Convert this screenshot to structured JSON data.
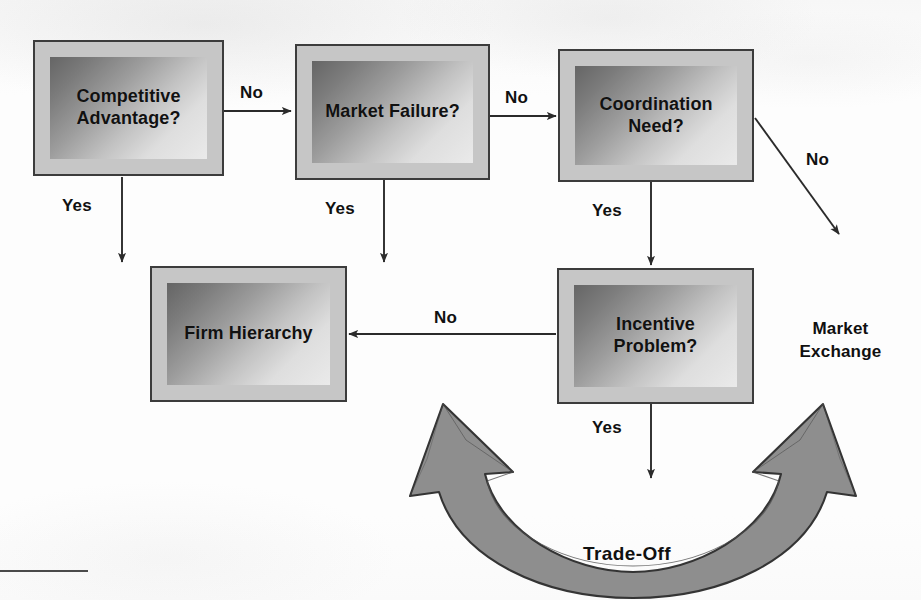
{
  "diagram": {
    "background_color": "#fcfcfc",
    "box_border_color": "#3c3c3c",
    "box_frame_color": "#c6c6c6",
    "box_gradient_from": "#656565",
    "box_gradient_to": "#eaeaea",
    "arrow_color": "#2b2b2b",
    "tradeoff_fill": "#8e8e8e",
    "tradeoff_stroke": "#3a3a3a"
  },
  "nodes": [
    {
      "id": "competitive-advantage",
      "label": "Competitive\nAdvantage?"
    },
    {
      "id": "market-failure",
      "label": "Market\nFailure?"
    },
    {
      "id": "coordination-need",
      "label": "Coordination\nNeed?"
    },
    {
      "id": "firm-hierarchy",
      "label": "Firm\nHierarchy"
    },
    {
      "id": "incentive-problem",
      "label": "Incentive\nProblem?"
    }
  ],
  "edges": [
    {
      "id": "ca-to-mf",
      "label": "No",
      "from": "competitive-advantage",
      "to": "market-failure"
    },
    {
      "id": "mf-to-cn",
      "label": "No",
      "from": "market-failure",
      "to": "coordination-need"
    },
    {
      "id": "ca-yes",
      "label": "Yes",
      "from": "competitive-advantage",
      "to": "firm-hierarchy"
    },
    {
      "id": "mf-yes",
      "label": "Yes",
      "from": "market-failure",
      "to": "firm-hierarchy"
    },
    {
      "id": "cn-yes",
      "label": "Yes",
      "from": "coordination-need",
      "to": "incentive-problem"
    },
    {
      "id": "cn-no",
      "label": "No",
      "from": "coordination-need",
      "to": "market-exchange"
    },
    {
      "id": "ip-no",
      "label": "No",
      "from": "incentive-problem",
      "to": "firm-hierarchy"
    },
    {
      "id": "ip-yes",
      "label": "Yes",
      "from": "incentive-problem",
      "to": "market-exchange"
    }
  ],
  "outcomes": [
    {
      "id": "market-exchange",
      "label": "Market\nExchange"
    }
  ],
  "tradeoff": {
    "label": "Trade-Off",
    "kind": "double-headed-curved-arrow"
  }
}
